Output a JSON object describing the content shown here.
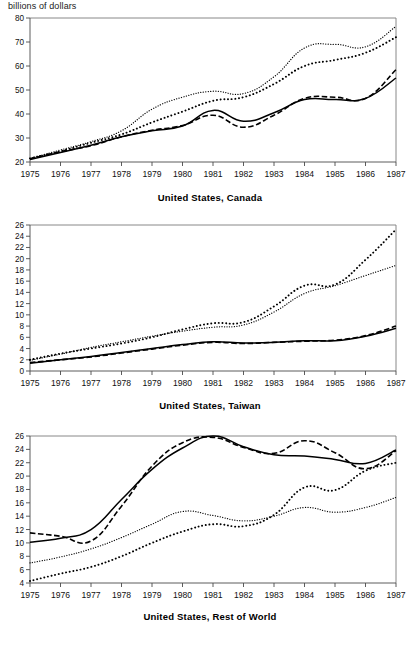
{
  "figure": {
    "unit_label": "billions of dollars",
    "x_tick_labels": [
      "1975",
      "1976",
      "1977",
      "1978",
      "1979",
      "1980",
      "1981",
      "1982",
      "1983",
      "1984",
      "1985",
      "1986",
      "1987"
    ]
  },
  "chart_data": [
    {
      "type": "line",
      "title": "United States, Canada",
      "xlabel": "",
      "ylabel": "billions of dollars",
      "x": [
        1975,
        1976,
        1977,
        1978,
        1979,
        1980,
        1981,
        1982,
        1983,
        1984,
        1985,
        1986,
        1987
      ],
      "xlim": [
        1975,
        1987
      ],
      "ylim": [
        20,
        80
      ],
      "yticks": [
        20,
        30,
        40,
        50,
        60,
        70,
        80
      ],
      "xticks": [
        1975,
        1976,
        1977,
        1978,
        1979,
        1980,
        1981,
        1982,
        1983,
        1984,
        1985,
        1986,
        1987
      ],
      "grid": false,
      "legend": "none",
      "series": [
        {
          "name": "series-solid",
          "style": "solid",
          "values": [
            21.0,
            24.0,
            27.0,
            30.5,
            33.0,
            35.0,
            41.5,
            37.0,
            40.5,
            46.0,
            46.0,
            46.5,
            55.0
          ]
        },
        {
          "name": "series-dashed",
          "style": "dashed",
          "values": [
            21.3,
            24.3,
            26.8,
            30.5,
            33.2,
            35.2,
            39.5,
            34.5,
            39.5,
            46.5,
            47.0,
            46.5,
            58.5
          ]
        },
        {
          "name": "series-dotted-big",
          "style": "dotted-large",
          "values": [
            21.5,
            24.5,
            28.0,
            31.5,
            36.5,
            41.0,
            45.5,
            47.0,
            52.5,
            60.0,
            62.5,
            65.5,
            72.0
          ]
        },
        {
          "name": "series-dotted-fine",
          "style": "dotted-fine",
          "values": [
            21.5,
            25.0,
            28.5,
            33.0,
            42.0,
            47.0,
            49.5,
            48.5,
            55.5,
            67.5,
            69.0,
            68.0,
            76.5
          ]
        }
      ]
    },
    {
      "type": "line",
      "title": "United States, Taiwan",
      "xlabel": "",
      "ylabel": "billions of dollars",
      "x": [
        1975,
        1976,
        1977,
        1978,
        1979,
        1980,
        1981,
        1982,
        1983,
        1984,
        1985,
        1986,
        1987
      ],
      "xlim": [
        1975,
        1987
      ],
      "ylim": [
        0,
        26
      ],
      "yticks": [
        0,
        2,
        4,
        6,
        8,
        10,
        12,
        14,
        16,
        18,
        20,
        22,
        24,
        26
      ],
      "xticks": [
        1975,
        1976,
        1977,
        1978,
        1979,
        1980,
        1981,
        1982,
        1983,
        1984,
        1985,
        1986,
        1987
      ],
      "grid": false,
      "legend": "none",
      "series": [
        {
          "name": "series-solid",
          "style": "solid",
          "values": [
            1.4,
            2.0,
            2.6,
            3.3,
            4.0,
            4.7,
            5.2,
            5.0,
            5.1,
            5.4,
            5.4,
            6.2,
            7.6
          ]
        },
        {
          "name": "series-dashed",
          "style": "dashed",
          "values": [
            1.5,
            2.0,
            2.5,
            3.2,
            3.9,
            4.6,
            5.1,
            4.9,
            5.1,
            5.3,
            5.5,
            6.3,
            8.0
          ]
        },
        {
          "name": "series-dotted-fine",
          "style": "dotted-fine",
          "values": [
            1.9,
            3.0,
            4.2,
            5.2,
            6.2,
            7.1,
            7.8,
            8.2,
            10.5,
            13.8,
            15.2,
            17.0,
            18.8
          ]
        },
        {
          "name": "series-dotted-big",
          "style": "dotted-large",
          "values": [
            2.0,
            3.1,
            4.0,
            4.9,
            6.0,
            7.4,
            8.5,
            8.7,
            11.5,
            15.2,
            15.4,
            19.8,
            25.2
          ]
        }
      ]
    },
    {
      "type": "line",
      "title": "United States, Rest of World",
      "xlabel": "",
      "ylabel": "billions of dollars",
      "x": [
        1975,
        1976,
        1977,
        1978,
        1979,
        1980,
        1981,
        1982,
        1983,
        1984,
        1985,
        1986,
        1987
      ],
      "xlim": [
        1975,
        1987
      ],
      "ylim": [
        4,
        26
      ],
      "yticks": [
        4,
        6,
        8,
        10,
        12,
        14,
        16,
        18,
        20,
        22,
        24,
        26
      ],
      "xticks": [
        1975,
        1976,
        1977,
        1978,
        1979,
        1980,
        1981,
        1982,
        1983,
        1984,
        1985,
        1986,
        1987
      ],
      "grid": false,
      "legend": "none",
      "series": [
        {
          "name": "series-solid",
          "style": "solid",
          "values": [
            10.1,
            10.7,
            12.0,
            16.5,
            21.0,
            24.2,
            26.0,
            24.4,
            23.2,
            23.0,
            22.5,
            21.9,
            23.9
          ]
        },
        {
          "name": "series-dashed",
          "style": "dashed",
          "values": [
            11.5,
            11.0,
            10.3,
            15.5,
            21.5,
            25.0,
            25.8,
            24.3,
            23.4,
            25.3,
            23.5,
            21.1,
            23.8
          ]
        },
        {
          "name": "series-dotted-fine",
          "style": "dotted-fine",
          "values": [
            7.0,
            7.9,
            9.1,
            10.8,
            12.8,
            14.7,
            14.1,
            13.3,
            14.0,
            15.3,
            14.6,
            15.3,
            16.8
          ]
        },
        {
          "name": "series-dotted-big",
          "style": "dotted-large",
          "values": [
            4.3,
            5.4,
            6.4,
            8.0,
            10.0,
            11.7,
            12.8,
            12.5,
            14.2,
            18.3,
            17.9,
            20.8,
            22.0
          ]
        }
      ]
    }
  ]
}
